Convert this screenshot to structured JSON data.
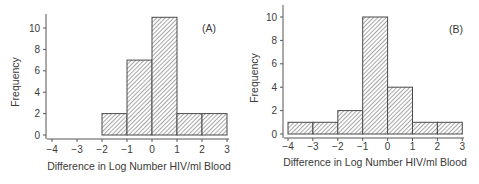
{
  "chart_data": [
    {
      "type": "bar",
      "subtype": "histogram",
      "panel_label": "(A)",
      "xlabel": "Difference in Log Number HIV/ml Blood",
      "ylabel": "Frequency",
      "x_ticks": [
        "−4",
        "−3",
        "−2",
        "−1",
        "0",
        "1",
        "2",
        "3"
      ],
      "x_tick_values": [
        -4,
        -3,
        -2,
        -1,
        0,
        1,
        2,
        3
      ],
      "y_ticks": [
        "0",
        "2",
        "4",
        "6",
        "8",
        "10"
      ],
      "y_tick_values": [
        0,
        2,
        4,
        6,
        8,
        10
      ],
      "xlim": [
        -4,
        3
      ],
      "ylim": [
        0,
        11
      ],
      "bins": [
        {
          "from": -2,
          "to": -1,
          "value": 2
        },
        {
          "from": -1,
          "to": 0,
          "value": 7
        },
        {
          "from": 0,
          "to": 1,
          "value": 11
        },
        {
          "from": 1,
          "to": 2,
          "value": 2
        },
        {
          "from": 2,
          "to": 3,
          "value": 2
        }
      ],
      "categories": [
        "-2 to -1",
        "-1 to 0",
        "0 to 1",
        "1 to 2",
        "2 to 3"
      ],
      "values": [
        2,
        7,
        11,
        2,
        2
      ],
      "fill": "diagonal hatch",
      "grid": false,
      "legend": null
    },
    {
      "type": "bar",
      "subtype": "histogram",
      "panel_label": "(B)",
      "xlabel": "Difference in Log Number HIV/ml Blood",
      "ylabel": "Frequency",
      "x_ticks": [
        "−4",
        "−3",
        "−2",
        "−1",
        "0",
        "1",
        "2",
        "3"
      ],
      "x_tick_values": [
        -4,
        -3,
        -2,
        -1,
        0,
        1,
        2,
        3
      ],
      "y_ticks": [
        "0",
        "2",
        "4",
        "6",
        "8",
        "10"
      ],
      "y_tick_values": [
        0,
        2,
        4,
        6,
        8,
        10
      ],
      "xlim": [
        -4,
        3
      ],
      "ylim": [
        0,
        10
      ],
      "bins": [
        {
          "from": -4,
          "to": -3,
          "value": 1
        },
        {
          "from": -3,
          "to": -2,
          "value": 1
        },
        {
          "from": -2,
          "to": -1,
          "value": 2
        },
        {
          "from": -1,
          "to": 0,
          "value": 10
        },
        {
          "from": 0,
          "to": 1,
          "value": 4
        },
        {
          "from": 1,
          "to": 2,
          "value": 1
        },
        {
          "from": 2,
          "to": 3,
          "value": 1
        }
      ],
      "categories": [
        "-4 to -3",
        "-3 to -2",
        "-2 to -1",
        "-1 to 0",
        "0 to 1",
        "1 to 2",
        "2 to 3"
      ],
      "values": [
        1,
        1,
        2,
        10,
        4,
        1,
        1
      ],
      "fill": "diagonal hatch",
      "grid": false,
      "legend": null
    }
  ],
  "colors": {
    "axis": "#555555",
    "bar_outline": "#4a4a4a",
    "hatch": "#6a6a6a",
    "text": "#3a3a3a",
    "background": "#ffffff"
  }
}
